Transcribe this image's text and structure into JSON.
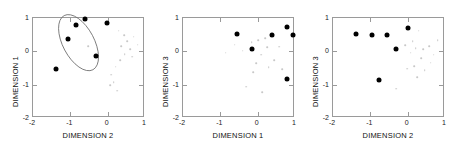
{
  "figure": {
    "background": "#ffffff",
    "marker_color": "#000000",
    "faint_color": "#c8c8c8",
    "axis_color": "#9a9a9a"
  },
  "chart_data": [
    {
      "type": "scatter",
      "title": "",
      "xlabel": "DIMENSION 2",
      "ylabel": "DIMENSION 1",
      "xlim": [
        -2,
        1
      ],
      "ylim": [
        -2,
        1
      ],
      "xticks": [
        -2,
        -1,
        0,
        1
      ],
      "yticks": [
        -2,
        -1,
        0,
        1
      ],
      "xticklabels": [
        "-2",
        "-1",
        "0",
        "1"
      ],
      "yticklabels": [
        "-2",
        "-1",
        "0",
        "1"
      ],
      "grid": false,
      "legend": "none",
      "series": [
        {
          "name": "selected",
          "marker": "filled-circle",
          "color": "#000000",
          "size": "large",
          "points": [
            [
              -0.62,
              0.98
            ],
            [
              -0.86,
              0.8
            ],
            [
              -1.05,
              0.38
            ],
            [
              -1.38,
              -0.52
            ],
            [
              -0.3,
              -0.14
            ],
            [
              -0.02,
              0.84
            ]
          ]
        },
        {
          "name": "background",
          "marker": "dot",
          "color": "#c8c8c8",
          "size": "small",
          "points": [
            [
              -0.52,
              0.16
            ],
            [
              0.3,
              0.62
            ],
            [
              0.44,
              0.48
            ],
            [
              0.52,
              0.3
            ],
            [
              0.36,
              0.16
            ],
            [
              0.6,
              0.06
            ],
            [
              0.46,
              -0.08
            ],
            [
              0.7,
              0.44
            ],
            [
              0.22,
              -0.46
            ],
            [
              0.1,
              -0.7
            ],
            [
              0.16,
              -0.92
            ],
            [
              0.06,
              -1.02
            ],
            [
              0.26,
              -1.18
            ],
            [
              0.34,
              -0.26
            ],
            [
              0.66,
              -0.16
            ],
            [
              0.8,
              0.2
            ]
          ]
        }
      ],
      "annotations": [
        {
          "type": "ellipse",
          "center": [
            -0.78,
            0.26
          ],
          "rx": 0.42,
          "ry": 0.92,
          "rotation_deg": -28,
          "stroke": "#6e6e6e"
        }
      ]
    },
    {
      "type": "scatter",
      "title": "",
      "xlabel": "DIMENSION 1",
      "ylabel": "DIMENSION 3",
      "xlim": [
        -2,
        1
      ],
      "ylim": [
        -2,
        1
      ],
      "xticks": [
        -2,
        -1,
        0,
        1
      ],
      "yticks": [
        -2,
        -1,
        0,
        1
      ],
      "xticklabels": [
        "-2",
        "-1",
        "0",
        "1"
      ],
      "yticklabels": [
        "-2",
        "-1",
        "0",
        "1"
      ],
      "grid": false,
      "legend": "none",
      "series": [
        {
          "name": "selected",
          "marker": "filled-circle",
          "color": "#000000",
          "size": "large",
          "points": [
            [
              -0.55,
              0.52
            ],
            [
              -0.15,
              0.08
            ],
            [
              0.38,
              0.49
            ],
            [
              0.78,
              0.72
            ],
            [
              0.95,
              0.5
            ],
            [
              0.78,
              -0.82
            ]
          ]
        },
        {
          "name": "background",
          "marker": "dot",
          "color": "#c8c8c8",
          "size": "small",
          "points": [
            [
              -0.62,
              0.2
            ],
            [
              -0.4,
              0.02
            ],
            [
              -0.86,
              -0.04
            ],
            [
              -0.16,
              0.28
            ],
            [
              0.02,
              0.34
            ],
            [
              0.2,
              0.4
            ],
            [
              0.26,
              0.12
            ],
            [
              0.1,
              -0.1
            ],
            [
              0.58,
              0.14
            ],
            [
              -0.04,
              -0.36
            ],
            [
              0.3,
              -0.48
            ],
            [
              -0.12,
              -0.62
            ],
            [
              0.44,
              -0.26
            ],
            [
              0.66,
              -0.54
            ],
            [
              -0.3,
              -1.06
            ],
            [
              0.12,
              -1.22
            ]
          ]
        }
      ],
      "annotations": []
    },
    {
      "type": "scatter",
      "title": "",
      "xlabel": "DIMENSION 2",
      "ylabel": "DIMENSION 3",
      "xlim": [
        -2,
        1
      ],
      "ylim": [
        -2,
        1
      ],
      "xticks": [
        -2,
        -1,
        0,
        1
      ],
      "yticks": [
        -2,
        -1,
        0,
        1
      ],
      "xticklabels": [
        "-2",
        "-1",
        "0",
        "1"
      ],
      "yticklabels": [
        "-2",
        "-1",
        "0",
        "1"
      ],
      "grid": false,
      "legend": "none",
      "series": [
        {
          "name": "selected",
          "marker": "filled-circle",
          "color": "#000000",
          "size": "large",
          "points": [
            [
              -1.38,
              0.52
            ],
            [
              -0.95,
              0.5
            ],
            [
              -0.55,
              0.5
            ],
            [
              -0.32,
              0.08
            ],
            [
              0.02,
              0.7
            ],
            [
              -0.78,
              -0.85
            ]
          ]
        },
        {
          "name": "background",
          "marker": "dot",
          "color": "#c8c8c8",
          "size": "small",
          "points": [
            [
              0.3,
              0.62
            ],
            [
              0.14,
              0.3
            ],
            [
              -0.06,
              0.18
            ],
            [
              0.22,
              0.1
            ],
            [
              0.42,
              0.06
            ],
            [
              0.58,
              0.16
            ],
            [
              0.08,
              -0.04
            ],
            [
              0.36,
              -0.2
            ],
            [
              0.62,
              -0.34
            ],
            [
              0.18,
              -0.44
            ],
            [
              -0.02,
              -0.52
            ],
            [
              0.46,
              -0.56
            ],
            [
              0.26,
              -0.78
            ],
            [
              -0.3,
              -1.12
            ],
            [
              0.7,
              -0.1
            ],
            [
              0.8,
              0.34
            ]
          ]
        }
      ],
      "annotations": []
    }
  ]
}
